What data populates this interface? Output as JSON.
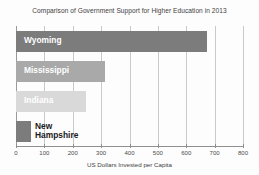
{
  "chart_data": {
    "type": "bar",
    "orientation": "horizontal",
    "title": "Comparison of Government Support for Higher Education in 2013",
    "xlabel": "US Dollars Invested per Capita",
    "ylabel": "",
    "xlim": [
      0,
      800
    ],
    "xticks": [
      0,
      100,
      200,
      300,
      400,
      500,
      600,
      700,
      800
    ],
    "xtick_labels": [
      "0",
      "100",
      "200",
      "300",
      "400",
      "500",
      "600",
      "700",
      "800"
    ],
    "grid": true,
    "grid_axis": "x",
    "legend": false,
    "categories": [
      "Wyoming",
      "Mississippi",
      "Indiana",
      "New Hampshire"
    ],
    "values": [
      673,
      313,
      245,
      53
    ],
    "bar_colors": [
      "#7c7c7c",
      "#a9a9a9",
      "#d9d9d9",
      "#7c7c7c"
    ],
    "bars": [
      {
        "label": "Wyoming",
        "value": 673,
        "color": "#7c7c7c",
        "label_style": "inside-white",
        "label_line1": "Wyoming",
        "label_line2": ""
      },
      {
        "label": "Mississippi",
        "value": 313,
        "color": "#a9a9a9",
        "label_style": "inside-white",
        "label_line1": "Mississippi",
        "label_line2": ""
      },
      {
        "label": "Indiana",
        "value": 245,
        "color": "#d9d9d9",
        "label_style": "inside-white",
        "label_line1": "Indiana",
        "label_line2": ""
      },
      {
        "label": "New Hampshire",
        "value": 53,
        "color": "#7c7c7c",
        "label_style": "outside-black",
        "label_line1": "New",
        "label_line2": "Hampshire"
      }
    ]
  }
}
